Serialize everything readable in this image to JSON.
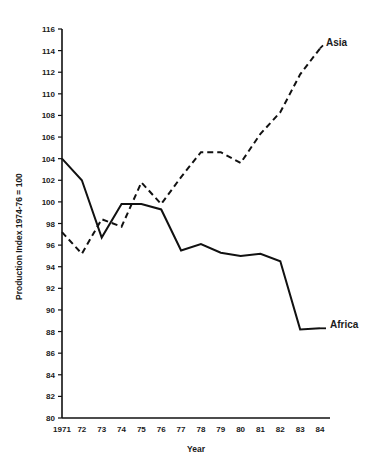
{
  "chart_data": {
    "type": "line",
    "title": "",
    "xlabel": "Year",
    "ylabel": "Production Index 1974-76 = 100",
    "categories": [
      "1971",
      "72",
      "73",
      "74",
      "75",
      "76",
      "77",
      "78",
      "79",
      "80",
      "81",
      "82",
      "83",
      "84"
    ],
    "x": [
      1971,
      1972,
      1973,
      1974,
      1975,
      1976,
      1977,
      1978,
      1979,
      1980,
      1981,
      1982,
      1983,
      1984
    ],
    "xlim": [
      1971,
      1984
    ],
    "ylim": [
      80,
      116
    ],
    "ytick_labels": [
      "80",
      "82",
      "84",
      "86",
      "88",
      "90",
      "92",
      "94",
      "96",
      "98",
      "100",
      "102",
      "104",
      "106",
      "108",
      "110",
      "112",
      "114",
      "116"
    ],
    "ytick_values": [
      80,
      82,
      84,
      86,
      88,
      90,
      92,
      94,
      96,
      98,
      100,
      102,
      104,
      106,
      108,
      110,
      112,
      114,
      116
    ],
    "grid": false,
    "legend_position": "inline-right-labels",
    "series": [
      {
        "name": "Africa",
        "style": "solid",
        "color": "#111111",
        "label_text": "Africa",
        "values": [
          104.0,
          102.0,
          96.7,
          99.8,
          99.8,
          99.3,
          95.5,
          96.1,
          95.3,
          95.0,
          95.2,
          94.5,
          88.2,
          88.3
        ]
      },
      {
        "name": "Asia",
        "style": "dashed",
        "color": "#111111",
        "label_text": "Asia",
        "values": [
          97.2,
          95.2,
          98.4,
          97.7,
          101.8,
          99.8,
          102.3,
          104.6,
          104.6,
          103.6,
          106.3,
          108.3,
          111.8,
          114.2
        ]
      }
    ]
  }
}
